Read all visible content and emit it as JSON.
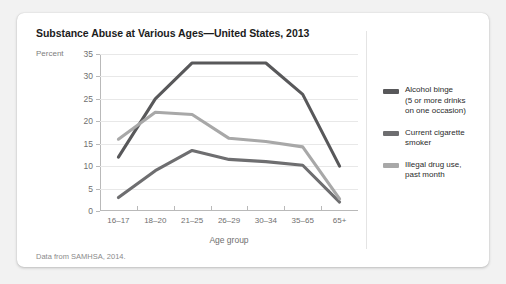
{
  "card": {
    "title": "Substance Abuse at Various Ages—United States, 2013",
    "source_note": "Data from SAMHSA, 2014."
  },
  "chart_data": {
    "type": "line",
    "title": "Substance Abuse at Various Ages—United States, 2013",
    "xlabel": "Age group",
    "ylabel": "Percent",
    "ylim": [
      0,
      35
    ],
    "yticks": [
      0,
      5,
      10,
      15,
      20,
      25,
      30,
      35
    ],
    "grid": true,
    "legend_position": "right",
    "categories": [
      "16–17",
      "18–20",
      "21–25",
      "26–29",
      "30–34",
      "35–65",
      "65+"
    ],
    "series": [
      {
        "name": "Alcohol binge (5 or more drinks on one occasion)",
        "legend_label_line1": "Alcohol binge",
        "legend_label_line2": "(5 or more drinks",
        "legend_label_line3": "on one occasion)",
        "color": "#58585a",
        "values": [
          12,
          25,
          33,
          33,
          33,
          26,
          10
        ]
      },
      {
        "name": "Current cigarette smoker",
        "legend_label_line1": "Current cigarette",
        "legend_label_line2": "smoker",
        "color": "#6e6e70",
        "values": [
          3,
          9,
          13.5,
          11.5,
          11,
          10.2,
          2
        ]
      },
      {
        "name": "Illegal drug use, past month",
        "legend_label_line1": "Illegal drug use,",
        "legend_label_line2": "past month",
        "color": "#a8a8a8",
        "values": [
          16,
          22,
          21.5,
          16.2,
          15.5,
          14.3,
          2.7
        ]
      }
    ]
  }
}
